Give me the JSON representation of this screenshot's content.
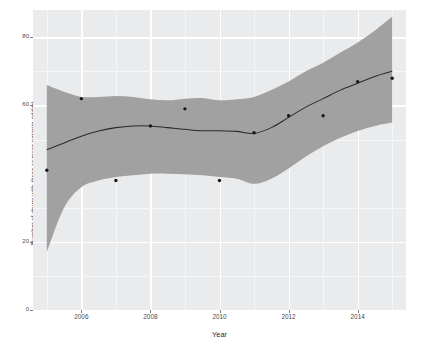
{
  "chart_data": {
    "type": "scatter",
    "title": "",
    "subtitle": "",
    "xlabel": "Year",
    "ylabel": "Number of drugs with three or more patents added",
    "xlim": [
      2004.6,
      2015.4
    ],
    "ylim": [
      0,
      88
    ],
    "xticks": [
      2006,
      2008,
      2010,
      2012,
      2014
    ],
    "xtick_labels": [
      "2006",
      "2008",
      "2010",
      "2012",
      "2014"
    ],
    "yticks": [
      0,
      20,
      60,
      80
    ],
    "ytick_labels": [
      "0",
      "20",
      "60",
      "80"
    ],
    "grid": true,
    "legend": "none",
    "series": [
      {
        "name": "observed",
        "type": "scatter",
        "marker": "filled-circle",
        "color": "#1a1a1a",
        "x": [
          2005,
          2006,
          2007,
          2008,
          2009,
          2010,
          2011,
          2012,
          2013,
          2014,
          2015
        ],
        "y": [
          41,
          62,
          38,
          54,
          59,
          38,
          52,
          57,
          57,
          67,
          68
        ]
      },
      {
        "name": "loess-trend",
        "type": "line",
        "color": "#2a2a2a",
        "x": [
          2005,
          2005.5,
          2006,
          2006.5,
          2007,
          2007.5,
          2008,
          2008.5,
          2009,
          2009.5,
          2010,
          2010.5,
          2011,
          2011.5,
          2012,
          2012.5,
          2013,
          2013.5,
          2014,
          2014.5,
          2015
        ],
        "y": [
          47,
          49,
          51,
          52.5,
          53.5,
          54,
          54,
          53.5,
          53,
          52.6,
          52.6,
          52.4,
          51.8,
          53.5,
          56.5,
          59.5,
          62,
          64.5,
          66.5,
          68.5,
          70
        ]
      }
    ],
    "confidence_band": {
      "name": "95% confidence interval",
      "fill": "#9a9a9a",
      "x": [
        2005,
        2005.5,
        2006,
        2006.5,
        2007,
        2007.5,
        2008,
        2008.5,
        2009,
        2009.5,
        2010,
        2010.5,
        2011,
        2011.5,
        2012,
        2012.5,
        2013,
        2013.5,
        2014,
        2014.5,
        2015
      ],
      "upper": [
        66,
        64,
        62.5,
        62.5,
        62.8,
        62.5,
        61.8,
        61.5,
        62,
        62.2,
        61.5,
        61.8,
        62.5,
        64.5,
        67,
        70,
        72.5,
        75.5,
        78.5,
        82,
        86
      ],
      "lower": [
        17,
        30,
        36,
        38,
        39,
        39.5,
        40,
        40,
        39.8,
        39.5,
        39,
        38.5,
        37,
        38.5,
        41.5,
        45,
        48,
        50.5,
        52.5,
        54,
        55
      ]
    }
  },
  "axes": {
    "x_title": "Year",
    "y_title": "Number of drugs with three or more patents added"
  },
  "style": {
    "panel_background": "#e9ebed",
    "grid_major": "#ffffff",
    "grid_minor": "#f5f6f7",
    "band_fill": "#9a9a9a",
    "line_color": "#2a2a2a",
    "point_color": "#1a1a1a",
    "text_color": "#4a4a4a"
  }
}
